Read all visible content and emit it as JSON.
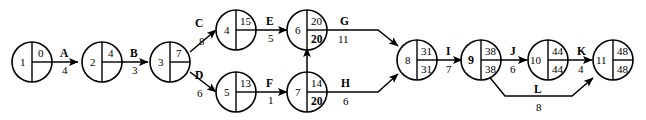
{
  "diagram": {
    "nodes": [
      {
        "id": "1",
        "early": "0",
        "late": "",
        "late_bold": false,
        "id_bold": false
      },
      {
        "id": "2",
        "early": "4",
        "late": "",
        "late_bold": false,
        "id_bold": false
      },
      {
        "id": "3",
        "early": "7",
        "late": "",
        "late_bold": false,
        "id_bold": false
      },
      {
        "id": "4",
        "early": "15",
        "late": "",
        "late_bold": false,
        "id_bold": false
      },
      {
        "id": "5",
        "early": "13",
        "late": "",
        "late_bold": false,
        "id_bold": false
      },
      {
        "id": "6",
        "early": "20",
        "late": "20",
        "late_bold": true,
        "id_bold": false
      },
      {
        "id": "7",
        "early": "14",
        "late": "20",
        "late_bold": true,
        "id_bold": false
      },
      {
        "id": "8",
        "early": "31",
        "late": "31",
        "late_bold": false,
        "id_bold": false
      },
      {
        "id": "9",
        "early": "38",
        "late": "38",
        "late_bold": false,
        "id_bold": true
      },
      {
        "id": "10",
        "early": "44",
        "late": "44",
        "late_bold": false,
        "id_bold": false
      },
      {
        "id": "11",
        "early": "48",
        "late": "48",
        "late_bold": false,
        "id_bold": false
      }
    ],
    "activities": [
      {
        "label": "A",
        "duration": "4",
        "from": "1",
        "to": "2"
      },
      {
        "label": "B",
        "duration": "3",
        "from": "2",
        "to": "3"
      },
      {
        "label": "C",
        "duration": "8",
        "from": "3",
        "to": "4"
      },
      {
        "label": "D",
        "duration": "6",
        "from": "3",
        "to": "5"
      },
      {
        "label": "E",
        "duration": "5",
        "from": "4",
        "to": "6"
      },
      {
        "label": "F",
        "duration": "1",
        "from": "5",
        "to": "7"
      },
      {
        "label": "G",
        "duration": "11",
        "from": "6",
        "to": "8"
      },
      {
        "label": "H",
        "duration": "6",
        "from": "7",
        "to": "8"
      },
      {
        "label": "I",
        "duration": "7",
        "from": "8",
        "to": "9"
      },
      {
        "label": "J",
        "duration": "6",
        "from": "9",
        "to": "10"
      },
      {
        "label": "K",
        "duration": "4",
        "from": "10",
        "to": "11"
      },
      {
        "label": "L",
        "duration": "8",
        "from": "9",
        "to": "11"
      }
    ],
    "dummy": {
      "label": "",
      "from": "7",
      "to": "6"
    },
    "colors": {
      "stroke": "#000000",
      "fill": "#ffffff"
    }
  }
}
